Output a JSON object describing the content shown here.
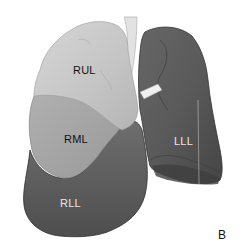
{
  "figure": {
    "panel_label": "B",
    "lobes": [
      {
        "id": "rul",
        "label": "RUL",
        "fill": "#c8c8c8"
      },
      {
        "id": "rml",
        "label": "RML",
        "fill": "#a9a9a9"
      },
      {
        "id": "rll",
        "label": "RLL",
        "fill": "#5c5c5c"
      },
      {
        "id": "lll",
        "label": "LLL",
        "fill": "#5a5a5a"
      }
    ],
    "trachea_fill": "#e2e2e2",
    "background": "#ffffff"
  }
}
